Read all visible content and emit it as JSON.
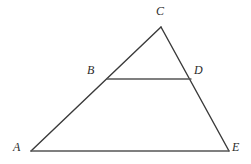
{
  "figure": {
    "kind": "geometry-diagram",
    "background_color": "#ffffff",
    "stroke_color": "#3a3a3a",
    "base_stroke_color": "#555555",
    "label_color": "#2b2b2b",
    "stroke_width": 1.4,
    "canvas": {
      "width": 251,
      "height": 164
    },
    "points": [
      {
        "id": "A",
        "label": "A",
        "x": 31,
        "y": 151,
        "label_x": 13,
        "label_y": 141
      },
      {
        "id": "B",
        "label": "B",
        "x": 107,
        "y": 79,
        "label_x": 87,
        "label_y": 64
      },
      {
        "id": "C",
        "label": "C",
        "x": 161,
        "y": 27,
        "label_x": 156,
        "label_y": 5
      },
      {
        "id": "D",
        "label": "D",
        "x": 191,
        "y": 79,
        "label_x": 194,
        "label_y": 64
      },
      {
        "id": "E",
        "label": "E",
        "x": 229,
        "y": 151,
        "label_x": 232,
        "label_y": 141
      }
    ],
    "segments": [
      {
        "id": "AC",
        "name": "segment-a-c",
        "from": "A",
        "to": "C"
      },
      {
        "id": "CE",
        "name": "segment-c-e",
        "from": "C",
        "to": "E"
      },
      {
        "id": "AE",
        "name": "segment-a-e",
        "from": "A",
        "to": "E"
      },
      {
        "id": "BD",
        "name": "segment-b-d",
        "from": "B",
        "to": "D"
      }
    ]
  }
}
